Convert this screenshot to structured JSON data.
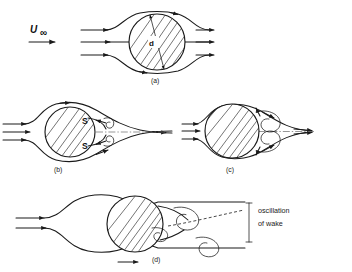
{
  "figure": {
    "freestream_label": "U",
    "freestream_subscript": "∞",
    "diameter_label": "d",
    "background_color": "#ffffff",
    "line_color": "#1a1a1a"
  },
  "panels": [
    {
      "id": "a",
      "label": "(a)",
      "description": "attached potential-like flow, streamlines close behind cylinder",
      "separation_labels": [],
      "vortex_count": 0
    },
    {
      "id": "b",
      "label": "(b)",
      "description": "steady separated flow with fixed twin vortices and separation points",
      "separation_labels": [
        "S",
        "S"
      ],
      "vortex_count": 2
    },
    {
      "id": "c",
      "label": "(c)",
      "description": "enlarged symmetric recirculating eddies in the near wake",
      "separation_labels": [],
      "vortex_count": 2
    },
    {
      "id": "d",
      "label": "(d)",
      "description": "unsteady alternating vortex street shed from the cylinder",
      "separation_labels": [],
      "vortex_count": 3
    }
  ],
  "annotations": {
    "oscillation_line_1": "oscillation",
    "oscillation_line_2": "of wake"
  }
}
